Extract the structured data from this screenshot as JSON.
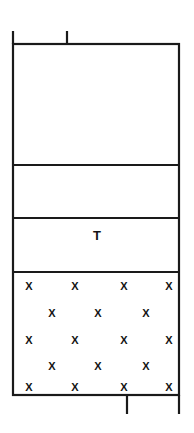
{
  "figure": {
    "type": "stratigraphic-column",
    "background_color": "#ffffff",
    "line_color": "#1a1a1a",
    "text_color": "#141414",
    "canvas": {
      "width": 194,
      "height": 433
    },
    "column": {
      "left": 13,
      "right": 179,
      "top": 44,
      "bottom": 395,
      "border_width": 2.2
    },
    "dividers": [
      {
        "name": "divider-1",
        "y": 165,
        "width": 2.0
      },
      {
        "name": "divider-2",
        "y": 218,
        "width": 2.0
      },
      {
        "name": "divider-3",
        "y": 272,
        "width": 2.0
      }
    ],
    "bands": [
      {
        "name": "band-1",
        "label": "",
        "top": 44,
        "bottom": 165,
        "fill": "#ffffff"
      },
      {
        "name": "band-2",
        "label": "",
        "top": 165,
        "bottom": 218,
        "fill": "#ffffff"
      },
      {
        "name": "band-3",
        "label": "T",
        "label_x": 97,
        "label_y": 237,
        "top": 218,
        "bottom": 272,
        "fill": "#ffffff"
      },
      {
        "name": "band-4",
        "label": "",
        "top": 272,
        "bottom": 395,
        "fill": "#ffffff"
      }
    ],
    "ticks": [
      {
        "name": "tick-top-left",
        "x": 13,
        "y1": 31,
        "y2": 44,
        "width": 2.2
      },
      {
        "name": "tick-top-middle",
        "x": 67,
        "y1": 31,
        "y2": 44,
        "width": 2.2
      },
      {
        "name": "tick-bottom-middle",
        "x": 127,
        "y1": 395,
        "y2": 414,
        "width": 2.2
      },
      {
        "name": "tick-bottom-right",
        "x": 179,
        "y1": 395,
        "y2": 414,
        "width": 2.2
      }
    ],
    "hatch": {
      "symbol": "X",
      "region_name": "band-4-hatch-fill",
      "rows": [
        {
          "y": 287,
          "xs": [
            29,
            75,
            124,
            169
          ]
        },
        {
          "y": 314,
          "xs": [
            52,
            98,
            146
          ]
        },
        {
          "y": 341,
          "xs": [
            29,
            75,
            124,
            169
          ]
        },
        {
          "y": 367,
          "xs": [
            52,
            98,
            146
          ]
        },
        {
          "y": 388,
          "xs": [
            29,
            75,
            124,
            169
          ]
        }
      ]
    }
  }
}
